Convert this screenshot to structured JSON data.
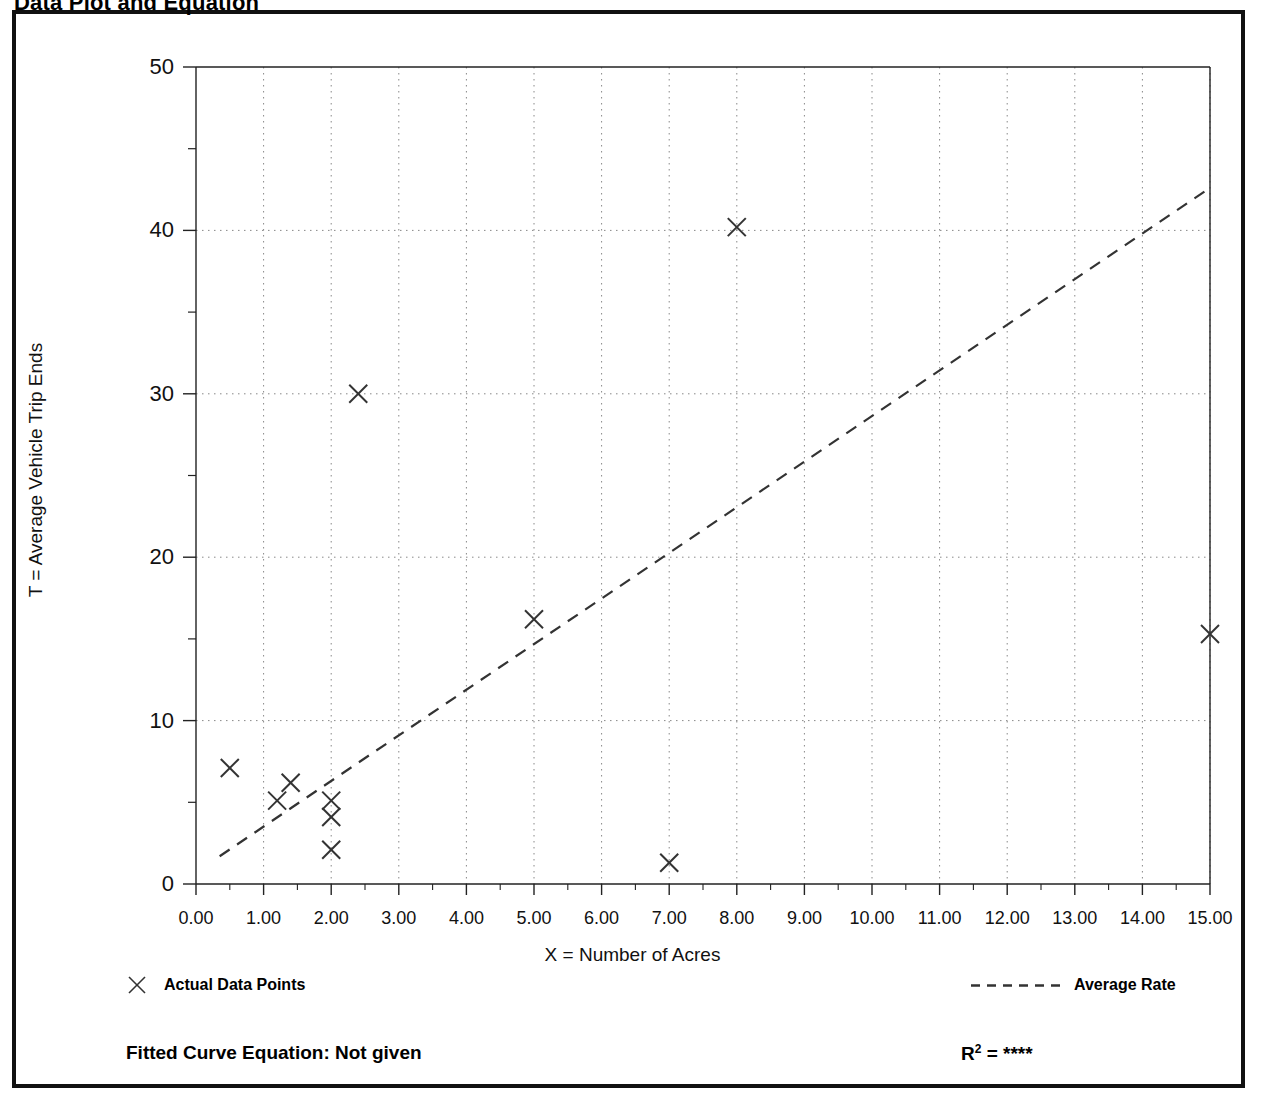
{
  "page": {
    "title": "Data Plot and Equation"
  },
  "legend": {
    "points_label": "Actual Data Points",
    "line_label": "Average Rate",
    "point_marker_icon": "x-marker-icon",
    "line_marker_icon": "dashed-line-icon"
  },
  "footer": {
    "fitted_equation": "Fitted Curve Equation:  Not given",
    "r2_prefix": "R",
    "r2_exponent": "2",
    "r2_value": "= ****"
  },
  "colors": {
    "frame": "#111111",
    "axis": "#222222",
    "grid": "#888888",
    "marker": "#333333",
    "trend": "#333333",
    "background": "#ffffff"
  },
  "chart_data": {
    "type": "scatter",
    "title": "Data Plot and Equation",
    "xlabel": "X = Number of Acres",
    "ylabel": "T = Average Vehicle Trip Ends",
    "xlim": [
      0,
      15
    ],
    "ylim": [
      0,
      50
    ],
    "xticks": [
      0,
      1,
      2,
      3,
      4,
      5,
      6,
      7,
      8,
      9,
      10,
      11,
      12,
      13,
      14,
      15
    ],
    "xtick_labels": [
      "0.00",
      "1.00",
      "2.00",
      "3.00",
      "4.00",
      "5.00",
      "6.00",
      "7.00",
      "8.00",
      "9.00",
      "10.00",
      "11.00",
      "12.00",
      "13.00",
      "14.00",
      "15.00"
    ],
    "yticks": [
      0,
      10,
      20,
      30,
      40,
      50
    ],
    "ytick_labels": [
      "0",
      "10",
      "20",
      "30",
      "40",
      "50"
    ],
    "y_minor_ticks": [
      5,
      15,
      25,
      35,
      45
    ],
    "grid": true,
    "grid_style": "dotted",
    "legend_position": "below-axes",
    "series": [
      {
        "name": "Actual Data Points",
        "type": "scatter",
        "marker": "x",
        "points": [
          {
            "x": 0.5,
            "y": 7.1
          },
          {
            "x": 1.2,
            "y": 5.1
          },
          {
            "x": 1.4,
            "y": 6.2
          },
          {
            "x": 2.0,
            "y": 5.1
          },
          {
            "x": 2.0,
            "y": 4.1
          },
          {
            "x": 2.0,
            "y": 2.1
          },
          {
            "x": 2.4,
            "y": 30.0
          },
          {
            "x": 5.0,
            "y": 16.2
          },
          {
            "x": 7.0,
            "y": 1.3
          },
          {
            "x": 8.0,
            "y": 40.2
          },
          {
            "x": 15.0,
            "y": 15.3
          }
        ]
      },
      {
        "name": "Average Rate",
        "type": "line",
        "style": "dashed",
        "endpoints": [
          {
            "x": 0.35,
            "y": 1.7
          },
          {
            "x": 15.0,
            "y": 42.6
          }
        ]
      }
    ]
  }
}
